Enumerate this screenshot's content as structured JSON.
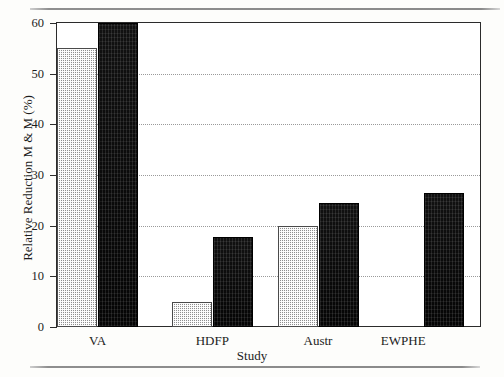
{
  "figure": {
    "background_color": "#fdfdfb",
    "plot_border_color": "#2b2b2b",
    "light_bar_color": "#b9b9b9",
    "dark_bar_color": "#0d0d0d",
    "gridline_color": "#9a9a9a"
  },
  "chart_data": {
    "type": "bar",
    "title": "",
    "xlabel": "Study",
    "ylabel": "Relative Reduction M & M (%)",
    "categories": [
      "VA",
      "HDFP",
      "Austr",
      "EWPHE"
    ],
    "series": [
      {
        "name": "light",
        "values": [
          55,
          5,
          20,
          null
        ]
      },
      {
        "name": "dark",
        "values": [
          60,
          17.8,
          24.5,
          26.5
        ]
      }
    ],
    "ylim": [
      0,
      60
    ],
    "yticks": [
      0,
      10,
      20,
      30,
      40,
      50,
      60
    ],
    "ytick_labels": [
      "0",
      "10",
      "20",
      "30",
      "40",
      "50",
      "60"
    ],
    "grid": true,
    "grid_style": "dotted",
    "legend": null
  }
}
